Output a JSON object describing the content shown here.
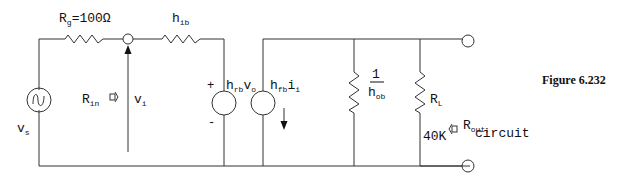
{
  "figure": {
    "caption": "Figure 6.232"
  },
  "labels": {
    "rg_main": "R",
    "rg_sub": "g",
    "rg_value": "=100Ω",
    "hib_main": "h",
    "hib_sub": "ib",
    "vs_main": "v",
    "vs_sub": "s",
    "rin_main": "R",
    "rin_sub": "in",
    "vi_main": "v",
    "vi_sub": "i",
    "plus": "+",
    "minus": "-",
    "hrb_main": "h",
    "hrb_sub": "rb",
    "hrb_v": "v",
    "hrb_vsub": "o",
    "hfb_main": "h",
    "hfb_sub": "fb",
    "hfb_i": "i",
    "hfb_isub": "i",
    "hob_num": "1",
    "hob_main": "h",
    "hob_sub": "ob",
    "rl_main": "R",
    "rl_sub": "L",
    "rl_value": "40K",
    "rout_main": "R",
    "rout_sub": "out,",
    "rout_circuit": "circuit"
  }
}
